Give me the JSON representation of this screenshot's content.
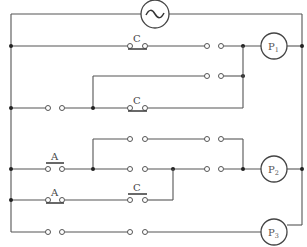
{
  "diagram": {
    "source": {
      "symbol": "~",
      "type": "AC source"
    },
    "labels": {
      "contact_c": "C",
      "pushbutton_a": "A",
      "lamp_p": "P",
      "p1_sub": "1",
      "p2_sub": "2",
      "p3_sub": "3"
    },
    "lamps": [
      {
        "name": "P1",
        "base": "P",
        "sub": "1"
      },
      {
        "name": "P2",
        "base": "P",
        "sub": "2"
      },
      {
        "name": "P3",
        "base": "P",
        "sub": "3"
      }
    ],
    "contacts": [
      {
        "row": 1,
        "type": "NC",
        "label": "C"
      },
      {
        "row": 3,
        "type": "NC",
        "label": "C"
      },
      {
        "row": 5,
        "type": "NO",
        "label": "A"
      },
      {
        "row": 6,
        "type": "NC",
        "label": "A"
      },
      {
        "row": 6,
        "type": "NO",
        "label": "C"
      }
    ],
    "colors": {
      "wire": "#555555",
      "background": "#ffffff"
    }
  }
}
